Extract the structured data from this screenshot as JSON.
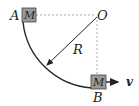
{
  "diagram": {
    "title": "",
    "labels": {
      "point_a": "A",
      "point_b": "B",
      "center": "O",
      "radius": "R",
      "block_a": "M",
      "block_b": "M",
      "velocity": "v"
    },
    "colors": {
      "block_fill": "#9a9a9a",
      "line": "#222222",
      "dashed": "#aaaaaa"
    }
  }
}
